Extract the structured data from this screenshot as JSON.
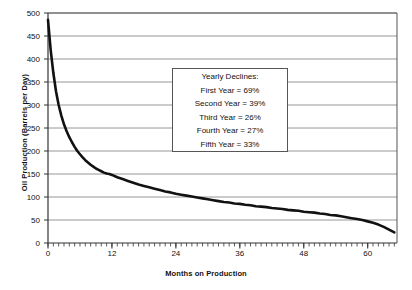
{
  "chart_data": {
    "type": "line",
    "title": "",
    "xlabel": "Months on Production",
    "ylabel": "Oil Production (Barrels per Day)",
    "xlim": [
      0,
      65.5
    ],
    "ylim": [
      0,
      500
    ],
    "xticks": [
      0,
      12,
      24,
      36,
      48,
      60
    ],
    "yticks": [
      0,
      50,
      100,
      150,
      200,
      250,
      300,
      350,
      400,
      450,
      500
    ],
    "grid": "horizontal",
    "legend": "none",
    "minor_xticks_interval": 1,
    "series": [
      {
        "name": "Oil Production",
        "color": "#111111",
        "x": [
          0,
          0.5,
          1,
          1.5,
          2,
          2.5,
          3,
          3.5,
          4,
          4.5,
          5,
          5.5,
          6,
          6.5,
          7,
          7.5,
          8,
          8.5,
          9,
          9.5,
          10,
          10.5,
          11,
          11.5,
          12,
          13,
          14,
          15,
          16,
          17,
          18,
          19,
          20,
          21,
          22,
          23,
          24,
          25,
          26,
          27,
          28,
          29,
          30,
          31,
          32,
          33,
          34,
          35,
          36,
          37,
          38,
          39,
          40,
          41,
          42,
          43,
          44,
          45,
          46,
          47,
          48,
          49,
          50,
          51,
          52,
          53,
          54,
          55,
          56,
          57,
          58,
          59,
          60,
          61,
          62,
          63,
          64,
          65
        ],
        "y": [
          485,
          420,
          370,
          330,
          300,
          277,
          258,
          243,
          230,
          219,
          209,
          200,
          193,
          186,
          180,
          175,
          170,
          166,
          162,
          159,
          156,
          153,
          151,
          150,
          148,
          143,
          139,
          135,
          131,
          127,
          124,
          121,
          118,
          115,
          112,
          110,
          107,
          105,
          103,
          101,
          99,
          97,
          95,
          93,
          91,
          89,
          88,
          86,
          85,
          83,
          82,
          80,
          79,
          78,
          76,
          75,
          74,
          72,
          71,
          70,
          68,
          67,
          66,
          64,
          63,
          61,
          60,
          58,
          56,
          54,
          52,
          50,
          47,
          44,
          40,
          35,
          29,
          23
        ]
      }
    ],
    "annotation": {
      "title": "Yearly Declines:",
      "rows": [
        "First Year = 69%",
        "Second Year = 39%",
        "Third Year = 26%",
        "Fourth Year = 27%",
        "Fifth Year = 33%"
      ]
    }
  },
  "axes": {
    "ylabel": "Oil Production (Barrels per Day)",
    "xlabel": "Months on Production",
    "ytick_labels": [
      "500",
      "450",
      "400",
      "350",
      "300",
      "250",
      "200",
      "150",
      "100",
      "50",
      "0"
    ],
    "xtick_labels": [
      "0",
      "12",
      "24",
      "36",
      "48",
      "60"
    ]
  },
  "annotation": {
    "title": "Yearly Declines:",
    "line1": "First Year = 69%",
    "line2": "Second Year = 39%",
    "line3": "Third Year = 26%",
    "line4": "Fourth Year = 27%",
    "line5": "Fifth Year = 33%"
  },
  "colors": {
    "curve": "#111111",
    "grid": "#8a8a8a",
    "axis": "#333333",
    "background": "#ffffff",
    "box_border": "#555555"
  }
}
